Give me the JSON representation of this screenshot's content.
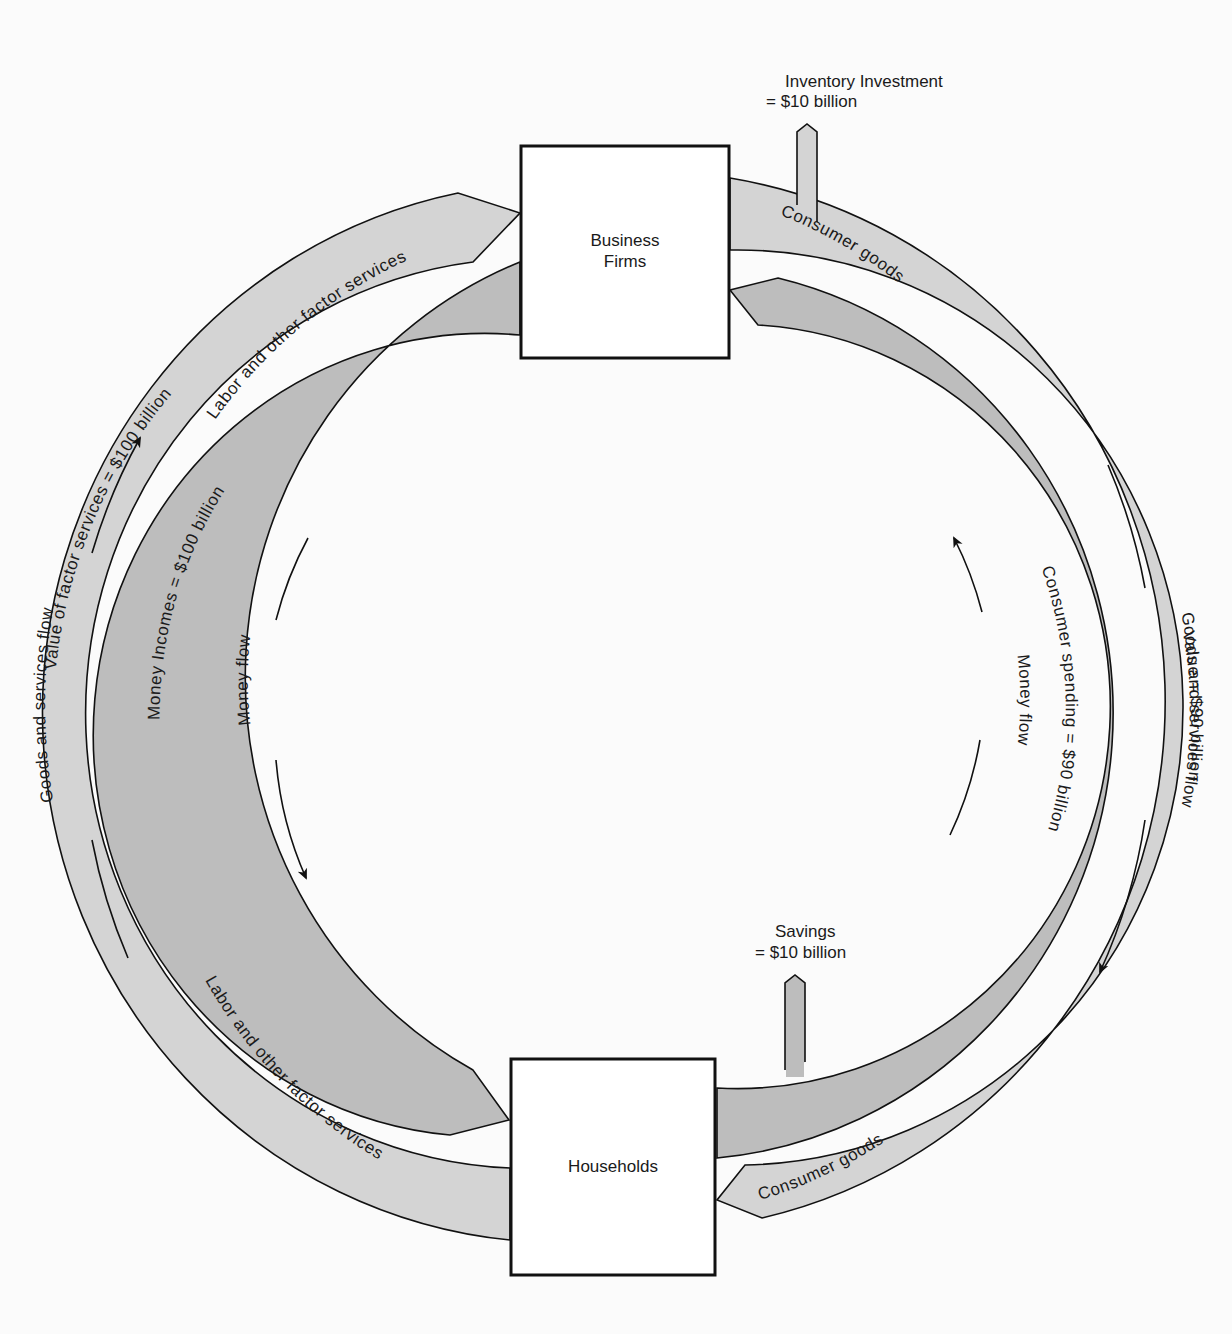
{
  "diagram": {
    "nodes": {
      "firms": {
        "label_line1": "Business",
        "label_line2": "Firms"
      },
      "households": {
        "label": "Households"
      }
    },
    "outer_band": {
      "color": "#d4d4d4",
      "top_left_label": "Labor and other factor services",
      "bottom_left_label": "Labor and other factor services",
      "top_right_label": "Consumer goods",
      "bottom_right_label": "Consumer goods",
      "left_value_label": "Value of factor services = $100 billion",
      "right_value_label": "Value = $90 billion"
    },
    "inner_band": {
      "color": "#bdbdbd",
      "left_label": "Money Incomes = $100 billion",
      "right_label": "Consumer spending = $90 billion"
    },
    "flow_labels": {
      "left_outer": "Goods and services flow",
      "right_outer": "Goods and services flow",
      "left_inner": "Money flow",
      "right_inner": "Money flow"
    },
    "leakages": {
      "inventory": {
        "line1": "Inventory Investment",
        "line2": "= $10 billion"
      },
      "savings": {
        "line1": "Savings",
        "line2": "= $10 billion"
      }
    }
  }
}
